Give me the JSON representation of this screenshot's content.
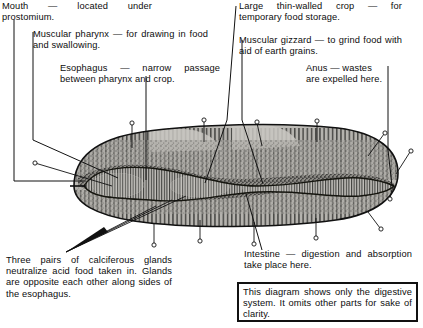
{
  "figure": {
    "title_text": ""
  },
  "annotations": {
    "mouth": {
      "name": "mouth",
      "text": "Mouth — located under prostomium."
    },
    "pharynx": {
      "name": "muscular-pharynx",
      "text": "Muscular pharynx — for drawing in food and swallowing."
    },
    "esophagus": {
      "name": "esophagus",
      "text": "Esophagus — narrow passage between pharynx and crop."
    },
    "crop": {
      "name": "crop",
      "text": "Large thin-walled crop — for temporary food storage."
    },
    "gizzard": {
      "name": "muscular-gizzard",
      "text": "Muscular gizzard — to grind food with aid of earth grains."
    },
    "anus": {
      "name": "anus",
      "text": "Anus — wastes are expelled here."
    },
    "calciferous_glands": {
      "name": "calciferous-glands",
      "text": "Three pairs of calciferous glands neutralize acid food taken in. Glands are opposite each other along sides of the esophagus."
    },
    "intestine": {
      "name": "intestine",
      "text": "Intestine — digestion and absorption take place here."
    }
  },
  "caption": {
    "text": "This diagram shows only the digestive system. It omits other parts for sake of clarity."
  },
  "colors": {
    "ink": "#111111",
    "paper": "#ffffff",
    "body_fill": "#b9b7b3",
    "body_shade": "#8e8c88",
    "body_dark": "#3a3a38"
  }
}
